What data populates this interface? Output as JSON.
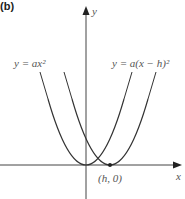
{
  "panel_label": "(b)",
  "axes": {
    "x_label": "x",
    "y_label": "y"
  },
  "curves": [
    {
      "name": "base-parabola",
      "label": "y = ax²",
      "equation": "y = ax^2",
      "vertex": "(0, 0)"
    },
    {
      "name": "shifted-parabola",
      "label": "y = a(x − h)²",
      "equation": "y = a(x - h)^2",
      "vertex": "(h, 0)"
    }
  ],
  "point_label": "(h, 0)",
  "colors": {
    "curve": "#333333",
    "axis": "#444444",
    "text": "#555555"
  }
}
